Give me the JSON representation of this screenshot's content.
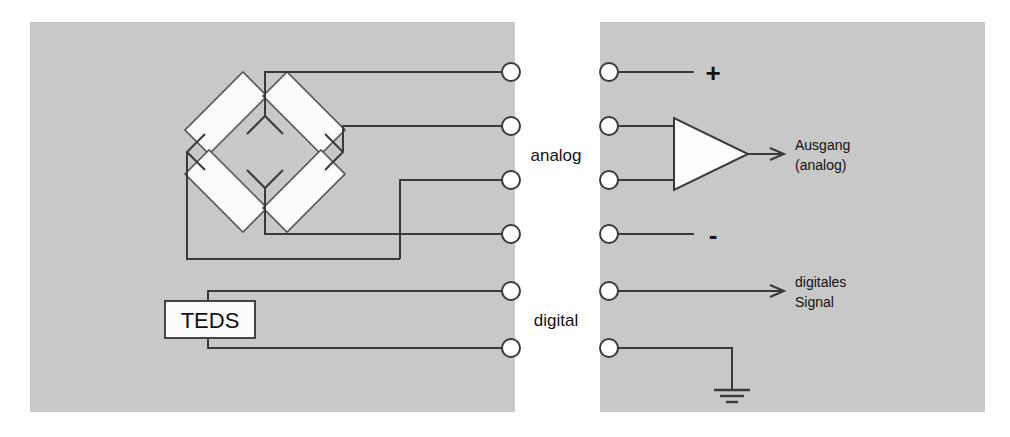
{
  "diagram": {
    "colors": {
      "panel_fill": "#c8c8c8",
      "background": "#ffffff",
      "wire": "#3a3a3a",
      "node_fill": "#ffffff",
      "resistor_fill": "#fbfbfb",
      "text": "#121212"
    },
    "panels": {
      "left": {
        "name": "sensor-side-panel",
        "x": 30,
        "y": 22,
        "width": 485,
        "height": 390
      },
      "right": {
        "name": "instrument-side-panel",
        "x": 600,
        "y": 22,
        "width": 385,
        "height": 390
      }
    },
    "gap_labels": {
      "analog": "analog",
      "digital": "digital"
    },
    "bridge": {
      "name": "wheatstone-bridge",
      "resistor_count": 4,
      "nodes": {
        "top": "excitation-positive",
        "right": "signal-positive",
        "bottom": "signal-negative",
        "left": "excitation-negative"
      }
    },
    "teds": {
      "label": "TEDS"
    },
    "amplifier": {
      "name": "differential-amplifier",
      "shape": "triangle"
    },
    "terminals": [
      {
        "index": 1,
        "y": 72,
        "name": "terminal-excitation-plus",
        "right_label": "+"
      },
      {
        "index": 2,
        "y": 126,
        "name": "terminal-signal-plus",
        "right_label": ""
      },
      {
        "index": 3,
        "y": 180,
        "name": "terminal-signal-minus",
        "right_label": ""
      },
      {
        "index": 4,
        "y": 234,
        "name": "terminal-excitation-minus",
        "right_label": "-"
      },
      {
        "index": 5,
        "y": 291,
        "name": "terminal-digital-signal",
        "right_label": ""
      },
      {
        "index": 6,
        "y": 348,
        "name": "terminal-digital-ground",
        "right_label": ""
      }
    ],
    "output_labels": {
      "plus": "+",
      "minus": "-",
      "analog_out_line1": "Ausgang",
      "analog_out_line2": "(analog)",
      "digital_out_line1": "digitales",
      "digital_out_line2": "Signal"
    },
    "ground": {
      "name": "earth-ground-symbol",
      "bars": 3
    }
  }
}
